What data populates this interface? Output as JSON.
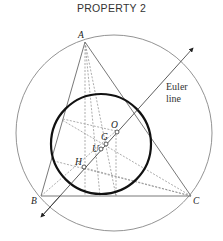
{
  "title": "PROPERTY 2",
  "labels": {
    "A": "A",
    "B": "B",
    "C": "C",
    "O": "O",
    "G": "G",
    "U": "U",
    "H": "H",
    "euler_line_1": "Euler",
    "euler_line_2": "line"
  }
}
